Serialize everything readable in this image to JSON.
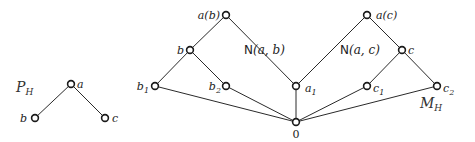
{
  "diagram": {
    "left_poset": {
      "name": "P",
      "name_sub": "H",
      "nodes": [
        {
          "id": "a",
          "label": "a"
        },
        {
          "id": "b",
          "label": "b"
        },
        {
          "id": "c",
          "label": "c"
        }
      ],
      "edges": [
        [
          "a",
          "b"
        ],
        [
          "a",
          "c"
        ]
      ]
    },
    "right_poset": {
      "name": "M",
      "name_sub": "H",
      "nodes": [
        {
          "id": "ab",
          "label": "a(b)"
        },
        {
          "id": "b",
          "label": "b"
        },
        {
          "id": "b1",
          "label": "b",
          "sub": "1"
        },
        {
          "id": "b2",
          "label": "b",
          "sub": "2"
        },
        {
          "id": "a1",
          "label": "a",
          "sub": "1"
        },
        {
          "id": "zero",
          "label": "0"
        },
        {
          "id": "ac",
          "label": "a(c)"
        },
        {
          "id": "c",
          "label": "c"
        },
        {
          "id": "c1",
          "label": "c",
          "sub": "1"
        },
        {
          "id": "c2",
          "label": "c",
          "sub": "2"
        }
      ],
      "edges": [
        [
          "ab",
          "b"
        ],
        [
          "ab",
          "a1"
        ],
        [
          "b",
          "b1"
        ],
        [
          "b",
          "b2"
        ],
        [
          "ac",
          "a1"
        ],
        [
          "ac",
          "c"
        ],
        [
          "c",
          "c1"
        ],
        [
          "c",
          "c2"
        ],
        [
          "b1",
          "zero"
        ],
        [
          "b2",
          "zero"
        ],
        [
          "a1",
          "zero"
        ],
        [
          "c1",
          "zero"
        ],
        [
          "c2",
          "zero"
        ]
      ],
      "regions": [
        {
          "id": "nab",
          "prefix": "N",
          "args": "(a, b)"
        },
        {
          "id": "nac",
          "prefix": "N",
          "args": "(a, c)"
        }
      ]
    }
  }
}
